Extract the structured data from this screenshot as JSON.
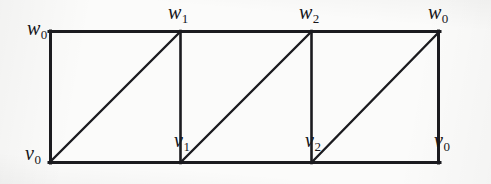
{
  "figure": {
    "name": "triangulated-rectangle-identification-diagram",
    "background_color": "#fbfbfa",
    "stroke_color": "#1b1b1f"
  },
  "geometry": {
    "rect": {
      "x": 49,
      "y": 31,
      "width": 391,
      "height": 132
    },
    "cell_count": 3,
    "interior_vertical_x": [
      180,
      311
    ],
    "diagonal_direction": "bottom-left-to-top-right"
  },
  "labels": {
    "top": [
      {
        "id": "w0-left",
        "base": "w",
        "sub": "0"
      },
      {
        "id": "w1",
        "base": "w",
        "sub": "1"
      },
      {
        "id": "w2",
        "base": "w",
        "sub": "2"
      },
      {
        "id": "w0-right",
        "base": "w",
        "sub": "0"
      }
    ],
    "bottom": [
      {
        "id": "v0-left",
        "base": "v",
        "sub": "0"
      },
      {
        "id": "v1",
        "base": "v",
        "sub": "1"
      },
      {
        "id": "v2",
        "base": "v",
        "sub": "2"
      },
      {
        "id": "v0-right",
        "base": "v",
        "sub": "0"
      }
    ]
  }
}
